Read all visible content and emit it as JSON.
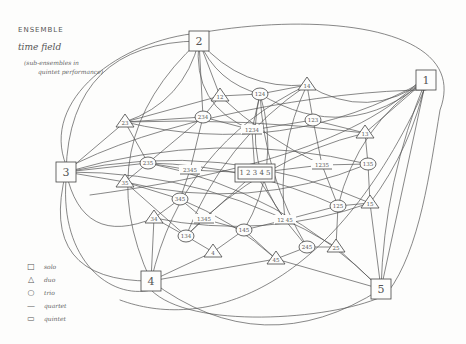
{
  "header": {
    "title": "ENSEMBLE",
    "subtitle": "time field",
    "note_line1": "(sub-ensembles in",
    "note_line2": "quintet performance)"
  },
  "legend": {
    "items": [
      {
        "symbol": "□",
        "label": "solo"
      },
      {
        "symbol": "△",
        "label": "duo"
      },
      {
        "symbol": "○",
        "label": "trio"
      },
      {
        "symbol": "—",
        "label": "quartet"
      },
      {
        "symbol": "▭",
        "label": "quintet"
      }
    ]
  },
  "nodes": {
    "solos": [
      {
        "id": "1",
        "label": "1",
        "x": 426,
        "y": 80
      },
      {
        "id": "2",
        "label": "2",
        "x": 199,
        "y": 41
      },
      {
        "id": "3",
        "label": "3",
        "x": 66,
        "y": 172
      },
      {
        "id": "4",
        "label": "4",
        "x": 151,
        "y": 281
      },
      {
        "id": "5",
        "label": "5",
        "x": 381,
        "y": 289
      }
    ],
    "duos": [
      {
        "id": "12",
        "label": "12",
        "x": 220,
        "y": 96
      },
      {
        "id": "14",
        "label": "14",
        "x": 307,
        "y": 85
      },
      {
        "id": "23",
        "label": "23",
        "x": 125,
        "y": 122
      },
      {
        "id": "13",
        "label": "13",
        "x": 365,
        "y": 133
      },
      {
        "id": "35",
        "label": "35",
        "x": 125,
        "y": 182
      },
      {
        "id": "34",
        "label": "34",
        "x": 154,
        "y": 218
      },
      {
        "id": "4b",
        "label": "4",
        "x": 213,
        "y": 252
      },
      {
        "id": "45",
        "label": "45",
        "x": 276,
        "y": 259
      },
      {
        "id": "25",
        "label": "25",
        "x": 336,
        "y": 247
      },
      {
        "id": "15",
        "label": "15",
        "x": 370,
        "y": 203
      }
    ],
    "trios": [
      {
        "id": "124",
        "label": "124",
        "x": 260,
        "y": 94
      },
      {
        "id": "234",
        "label": "234",
        "x": 203,
        "y": 117
      },
      {
        "id": "123",
        "label": "123",
        "x": 313,
        "y": 120
      },
      {
        "id": "235",
        "label": "235",
        "x": 148,
        "y": 163
      },
      {
        "id": "135",
        "label": "135",
        "x": 368,
        "y": 164
      },
      {
        "id": "345",
        "label": "345",
        "x": 180,
        "y": 199
      },
      {
        "id": "134",
        "label": "134",
        "x": 186,
        "y": 236
      },
      {
        "id": "145",
        "label": "145",
        "x": 244,
        "y": 230
      },
      {
        "id": "245",
        "label": "245",
        "x": 307,
        "y": 247
      },
      {
        "id": "125",
        "label": "125",
        "x": 338,
        "y": 206
      }
    ],
    "quartets": [
      {
        "id": "1234",
        "label": "1234",
        "x": 252,
        "y": 130
      },
      {
        "id": "2345",
        "label": "2345",
        "x": 190,
        "y": 170
      },
      {
        "id": "1235",
        "label": "1235",
        "x": 322,
        "y": 165
      },
      {
        "id": "1345",
        "label": "1345",
        "x": 204,
        "y": 219
      },
      {
        "id": "1245",
        "label": "12 45",
        "x": 285,
        "y": 220
      }
    ],
    "quintet": {
      "id": "12345",
      "label": "1 2 3 4 5",
      "x": 255,
      "y": 173
    }
  }
}
